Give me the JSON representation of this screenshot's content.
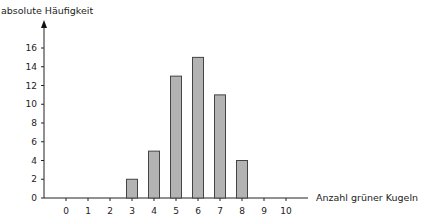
{
  "chart_data": {
    "type": "bar",
    "title": "",
    "ylabel": "absolute Häufigkeit",
    "xlabel": "Anzahl grüner Kugeln",
    "categories": [
      "0",
      "1",
      "2",
      "3",
      "4",
      "5",
      "6",
      "7",
      "8",
      "9",
      "10"
    ],
    "values": [
      0,
      0,
      0,
      2,
      5,
      13,
      15,
      11,
      4,
      0,
      0
    ],
    "yticks": [
      0,
      2,
      4,
      6,
      8,
      10,
      12,
      14,
      16
    ],
    "ylim": [
      0,
      17
    ],
    "grid": false,
    "legend": null,
    "bar_color": "#b3b3b3",
    "bar_edge_color": "#444444"
  }
}
